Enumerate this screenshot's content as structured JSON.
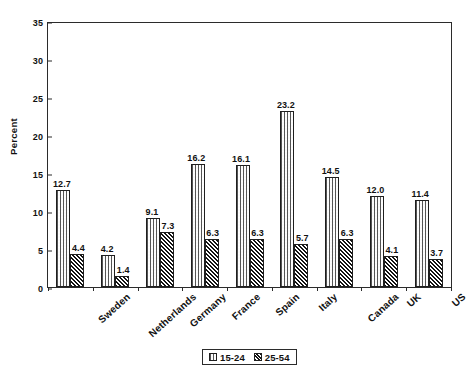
{
  "chart_data": {
    "type": "bar",
    "title": "",
    "xlabel": "",
    "ylabel": "Percent",
    "ylim": [
      0,
      35
    ],
    "yticks": [
      0,
      5,
      10,
      15,
      20,
      25,
      30,
      35
    ],
    "grid": false,
    "legend_position": "bottom-center",
    "categories": [
      "Sweden",
      "Netherlands",
      "Germany",
      "France",
      "Spain",
      "Italy",
      "Canada",
      "UK",
      "US"
    ],
    "series": [
      {
        "name": "15-24",
        "pattern": "fine-vertical-dotted",
        "values": [
          12.7,
          4.2,
          9.1,
          16.2,
          16.1,
          23.2,
          14.5,
          12.0,
          11.4
        ],
        "labels": [
          "12.7",
          "4.2",
          "9.1",
          "16.2",
          "16.1",
          "23.2",
          "14.5",
          "12.0",
          "11.4"
        ]
      },
      {
        "name": "25-54",
        "pattern": "dark-diagonal-crosshatch",
        "values": [
          4.4,
          1.4,
          7.3,
          6.3,
          6.3,
          5.7,
          6.3,
          4.1,
          3.7
        ],
        "labels": [
          "4.4",
          "1.4",
          "7.3",
          "6.3",
          "6.3",
          "5.7",
          "6.3",
          "4.1",
          "3.7"
        ]
      }
    ]
  },
  "colors": {
    "axis": "#2b2b2b",
    "text": "#111111",
    "series_15_24_fill": "#fcfcfc",
    "series_25_54_fill": "#6d6d6d",
    "background": "#ffffff"
  }
}
